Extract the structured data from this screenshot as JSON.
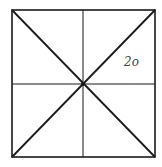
{
  "diagram": {
    "type": "square-divided-into-eight-triangles",
    "square": {
      "x1": 12,
      "y1": 10,
      "x2": 155,
      "y2": 157
    },
    "center": {
      "x": 83,
      "y": 84
    },
    "stroke_color": "#1a1a1a",
    "label": {
      "text": "2o",
      "x": 124,
      "y": 66
    }
  }
}
